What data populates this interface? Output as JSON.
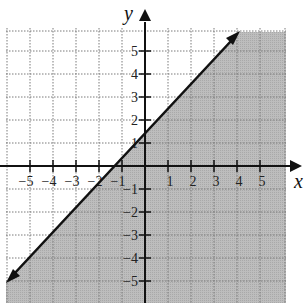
{
  "graph": {
    "x_axis_label": "x",
    "y_axis_label": "y",
    "x_ticks": [
      "−5",
      "−4",
      "−3",
      "−2",
      "−1",
      "1",
      "2",
      "3",
      "4",
      "5"
    ],
    "y_ticks": [
      "5",
      "4",
      "3",
      "2",
      "1",
      "−1",
      "−2",
      "−3",
      "−4",
      "−5"
    ],
    "boundary_line": "y = x + 2",
    "boundary_style": "solid",
    "shaded_region": "below the line (y < x + 2 or y ≤ x + 2)",
    "colors": {
      "shade": "#b8b8b8",
      "grid": "#777777",
      "axis": "#111111",
      "line": "#111111",
      "background": "#ffffff"
    }
  }
}
